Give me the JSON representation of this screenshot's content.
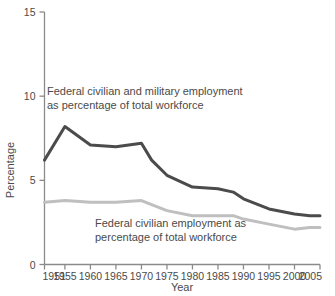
{
  "chart_data": {
    "type": "line",
    "title": "",
    "xlabel": "Year",
    "ylabel": "Percentage",
    "xlim": [
      1951,
      2005
    ],
    "ylim": [
      0,
      15
    ],
    "yticks": [
      "0",
      "5",
      "10",
      "15"
    ],
    "ytick_values": [
      0,
      5,
      10,
      15
    ],
    "xticks": [
      "1951",
      "1955",
      "1960",
      "1965",
      "1970",
      "1975",
      "1980",
      "1985",
      "1990",
      "1995",
      "2000",
      "2005"
    ],
    "xtick_values": [
      1951,
      1955,
      1960,
      1965,
      1970,
      1975,
      1980,
      1985,
      1990,
      1995,
      2000,
      2005
    ],
    "grid": false,
    "legend": "annotations",
    "series": [
      {
        "name": "Federal civilian and military employment as percentage of total workforce",
        "color": "#4b4b4b",
        "x": [
          1951,
          1955,
          1960,
          1965,
          1970,
          1972,
          1975,
          1980,
          1985,
          1988,
          1990,
          1995,
          2000,
          2003,
          2005
        ],
        "values": [
          6.2,
          8.2,
          7.1,
          7.0,
          7.2,
          6.2,
          5.3,
          4.6,
          4.5,
          4.3,
          3.9,
          3.3,
          3.0,
          2.9,
          2.9
        ]
      },
      {
        "name": "Federal civilian employment as percentage of total workforce",
        "color": "#bfbfbf",
        "x": [
          1951,
          1955,
          1960,
          1965,
          1970,
          1975,
          1980,
          1985,
          1988,
          1990,
          1995,
          2000,
          2003,
          2005
        ],
        "values": [
          3.7,
          3.8,
          3.7,
          3.7,
          3.8,
          3.2,
          2.9,
          2.9,
          2.9,
          2.7,
          2.4,
          2.1,
          2.2,
          2.2
        ]
      }
    ],
    "annotations": [
      {
        "id": "upper-annotation",
        "lines": [
          "Federal civilian and military employment",
          "as percentage of total workforce"
        ],
        "x": 47,
        "y": 95
      },
      {
        "id": "lower-annotation",
        "lines": [
          "Federal civilian employment as",
          "percentage of total workforce"
        ],
        "x": 95,
        "y": 227
      }
    ],
    "colors": {
      "series_dark": "#4b4b4b",
      "series_light": "#bfbfbf",
      "axis": "#8a8a8a",
      "text": "#4a4a4a",
      "background": "#ffffff"
    }
  }
}
